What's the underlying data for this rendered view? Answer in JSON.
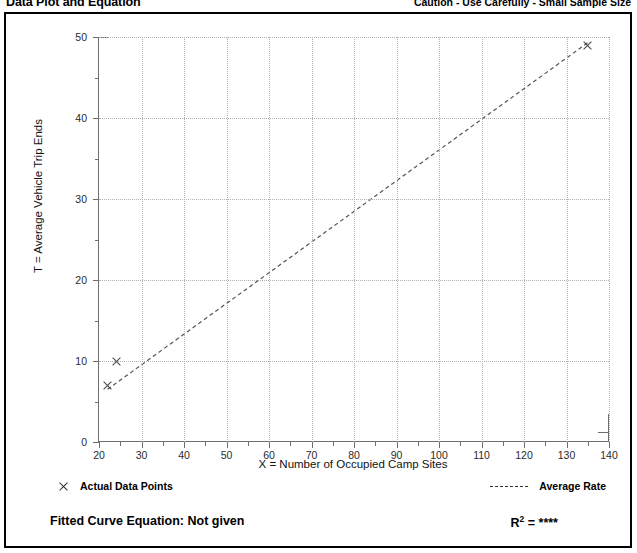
{
  "header": {
    "title": "Data Plot and Equation",
    "caution": "Caution - Use Carefully - Small Sample Size"
  },
  "legend": {
    "data_points_label": "Actual Data Points",
    "average_rate_label": "Average Rate",
    "data_points_marker": "x-marker-icon",
    "average_rate_marker": "dashed-line-icon"
  },
  "footer": {
    "fitted_curve_label": "Fitted Curve Equation:",
    "fitted_curve_value": "Not given",
    "r_squared_label": "R",
    "r_squared_exponent": "2",
    "r_squared_equals": " = ",
    "r_squared_value": "****"
  },
  "chart_data": {
    "type": "scatter",
    "title": "Data Plot and Equation",
    "xlabel": "X = Number of Occupied Camp Sites",
    "ylabel": "T = Average Vehicle Trip Ends",
    "xlim": [
      20,
      140
    ],
    "ylim": [
      0,
      50
    ],
    "xticks": [
      20,
      30,
      40,
      50,
      60,
      70,
      80,
      90,
      100,
      110,
      120,
      130,
      140
    ],
    "xtick_labels": [
      "20",
      "30",
      "40",
      "50",
      "60",
      "70",
      "80",
      "90",
      "100",
      "110",
      "120",
      "130",
      "140"
    ],
    "xminor_ticks": [
      25,
      35,
      45,
      55,
      65,
      75,
      85,
      95,
      105,
      115,
      125,
      135
    ],
    "yticks": [
      0,
      10,
      20,
      30,
      40,
      50
    ],
    "ytick_labels": [
      "0",
      "10",
      "20",
      "30",
      "40",
      "50"
    ],
    "yminor_ticks": [
      5,
      15,
      25,
      35,
      45
    ],
    "grid": true,
    "grid_style": "dotted",
    "legend_position": "below-plot",
    "series": [
      {
        "name": "Actual Data Points",
        "type": "scatter",
        "marker": "x",
        "points": [
          {
            "x": 22,
            "y": 7
          },
          {
            "x": 24,
            "y": 10
          },
          {
            "x": 135,
            "y": 49
          }
        ]
      },
      {
        "name": "Average Rate",
        "type": "line",
        "style": "dashed",
        "points": [
          {
            "x": 22,
            "y": 6.5
          },
          {
            "x": 135,
            "y": 49.3
          }
        ]
      }
    ],
    "annotations": {
      "fitted_curve_equation": "Not given",
      "r_squared": "****",
      "caution": "Caution - Use Carefully - Small Sample Size"
    }
  }
}
